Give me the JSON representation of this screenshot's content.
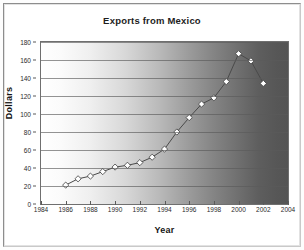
{
  "chart_data": {
    "type": "line",
    "title": "Exports from Mexico",
    "xlabel": "Year",
    "ylabel": "Dollars",
    "x": [
      1986,
      1987,
      1988,
      1989,
      1990,
      1991,
      1992,
      1993,
      1994,
      1995,
      1996,
      1997,
      1998,
      1999,
      2000,
      2001,
      2002
    ],
    "values": [
      21,
      28,
      31,
      36,
      41,
      43,
      46,
      52,
      61,
      80,
      96,
      111,
      118,
      136,
      167,
      159,
      134
    ],
    "series": [
      {
        "name": "Exports from Mexico",
        "values": [
          21,
          28,
          31,
          36,
          41,
          43,
          46,
          52,
          61,
          80,
          96,
          111,
          118,
          136,
          167,
          159,
          134
        ]
      }
    ],
    "xlim": [
      1984,
      2004
    ],
    "ylim": [
      0,
      180
    ],
    "x_ticks": [
      "1984",
      "1986",
      "1988",
      "1990",
      "1992",
      "1994",
      "1996",
      "1998",
      "2000",
      "2002",
      "2004"
    ],
    "x_tick_values": [
      1984,
      1986,
      1988,
      1990,
      1992,
      1994,
      1996,
      1998,
      2000,
      2002,
      2004
    ],
    "y_ticks": [
      "0",
      "20",
      "40",
      "60",
      "80",
      "100",
      "120",
      "140",
      "160",
      "180"
    ],
    "y_tick_values": [
      0,
      20,
      40,
      60,
      80,
      100,
      120,
      140,
      160,
      180
    ],
    "grid": "horizontal",
    "legend": "none",
    "marker": "diamond",
    "marker_fill": "#ffffff",
    "line_color": "#4a4a4a",
    "plot_background": "horizontal gradient white to dark gray"
  },
  "colors": {
    "line": "#4a4a4a",
    "marker_fill": "#ffffff",
    "marker_stroke": "#3c3c3c",
    "grid": "#5a5a5a",
    "axis": "#6f6f6f",
    "text": "#1d1d1d",
    "frame": "#9a9a9a"
  }
}
